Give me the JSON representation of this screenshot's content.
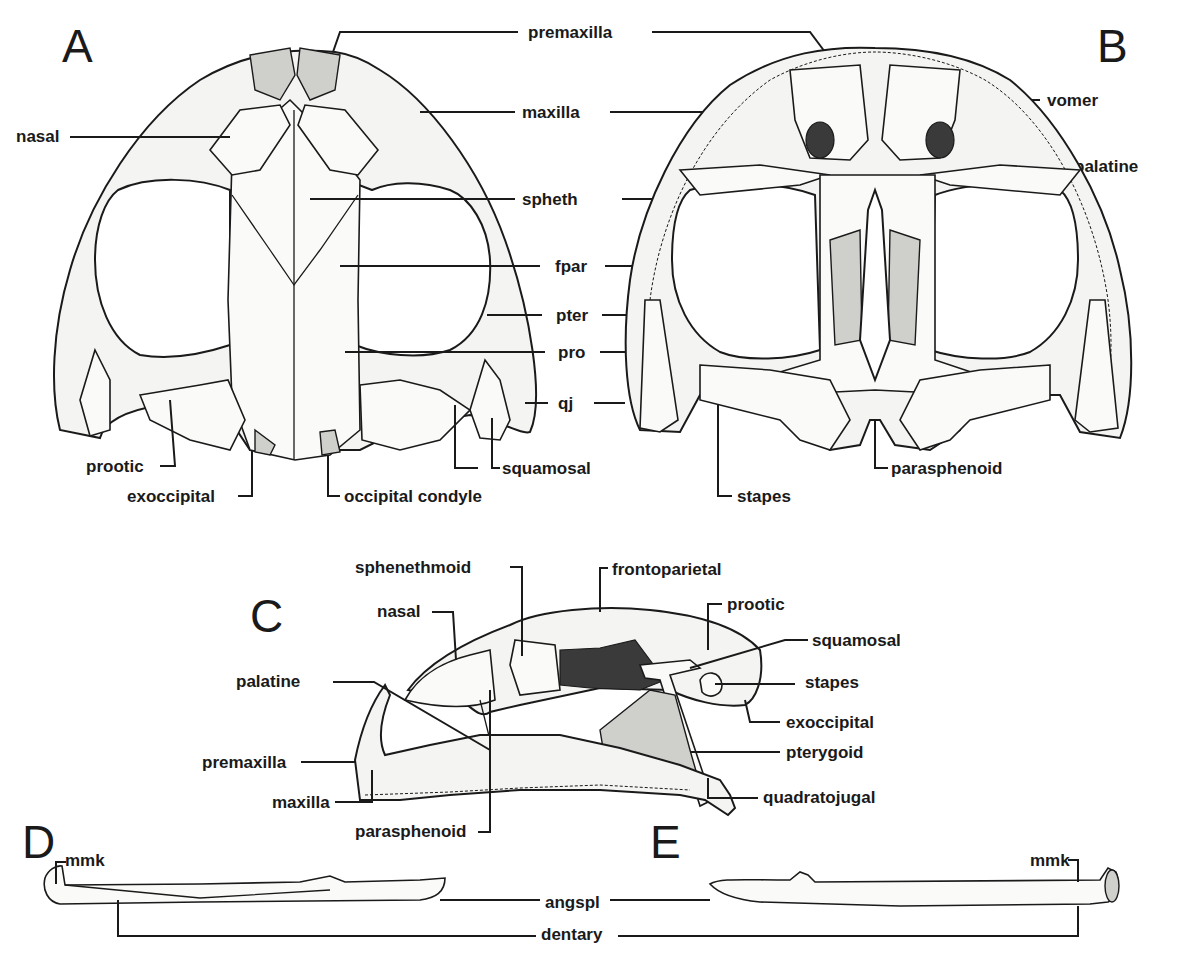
{
  "figure": {
    "panels": [
      {
        "id": "A",
        "label": "A",
        "view": "dorsal skull"
      },
      {
        "id": "B",
        "label": "B",
        "view": "ventral skull"
      },
      {
        "id": "C",
        "label": "C",
        "view": "lateral skull"
      },
      {
        "id": "D",
        "label": "D",
        "view": "lower jaw"
      },
      {
        "id": "E",
        "label": "E",
        "view": "lower jaw"
      }
    ],
    "labels_AB": {
      "premaxilla": "premaxilla",
      "maxilla": "maxilla",
      "nasal": "nasal",
      "vomer": "vomer",
      "palatine": "palatine",
      "spheth": "spheth",
      "fpar": "fpar",
      "pter": "pter",
      "pro": "pro",
      "qj": "qj",
      "prootic": "prootic",
      "exoccipital": "exoccipital",
      "occipital_condyle": "occipital condyle",
      "squamosal": "squamosal",
      "parasphenoid": "parasphenoid",
      "stapes": "stapes"
    },
    "labels_C": {
      "sphenethmoid": "sphenethmoid",
      "frontoparietal": "frontoparietal",
      "nasal": "nasal",
      "prootic": "prootic",
      "squamosal": "squamosal",
      "palatine": "palatine",
      "stapes": "stapes",
      "exoccipital": "exoccipital",
      "pterygoid": "pterygoid",
      "premaxilla": "premaxilla",
      "maxilla": "maxilla",
      "quadratojugal": "quadratojugal",
      "parasphenoid": "parasphenoid"
    },
    "labels_DE": {
      "mmk_left": "mmk",
      "mmk_right": "mmk",
      "angspl": "angspl",
      "dentary": "dentary"
    }
  }
}
